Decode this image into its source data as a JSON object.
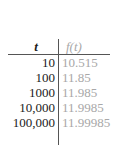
{
  "table": {
    "headers": {
      "left": "t",
      "right": "f(t)"
    },
    "rows": [
      {
        "t": "10",
        "f": "10.515"
      },
      {
        "t": "100",
        "f": "11.85"
      },
      {
        "t": "1000",
        "f": "11.985"
      },
      {
        "t": "10,000",
        "f": "11.9985"
      },
      {
        "t": "100,000",
        "f": "11.99985"
      }
    ]
  },
  "colors": {
    "left_text": "#1a1a1a",
    "right_text": "#a8a8a8",
    "rule": "#555555"
  }
}
